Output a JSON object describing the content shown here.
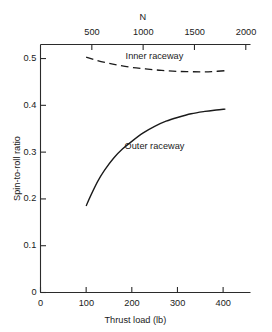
{
  "chart_data": {
    "type": "line",
    "title": "",
    "xlabel": "Thrust load (lb)",
    "ylabel": "Spin-to-roll ratio",
    "secondary_xlabel": "N",
    "xlim": [
      0,
      460
    ],
    "ylim": [
      0,
      0.53
    ],
    "secondary_xlim": [
      0,
      2046
    ],
    "xticks": [
      0,
      100,
      200,
      300,
      400
    ],
    "xtick_labels": [
      "0",
      "100",
      "200",
      "300",
      "400"
    ],
    "yticks": [
      0,
      0.1,
      0.2,
      0.3,
      0.4,
      0.5
    ],
    "ytick_labels": [
      "0",
      "0.1",
      "0.2",
      "0.3",
      "0.4",
      "0.5"
    ],
    "secondary_xticks": [
      500,
      1000,
      1500,
      2000
    ],
    "secondary_xtick_labels": [
      "500",
      "1000",
      "1500",
      "2000"
    ],
    "grid": false,
    "legend": "inline-annotations",
    "series": [
      {
        "name": "Inner raceway",
        "style": "dashed",
        "color": "#1a1a1a",
        "label_x": 250,
        "label_y": 0.505,
        "x": [
          100,
          120,
          145,
          170,
          200,
          230,
          260,
          290,
          320,
          350,
          375,
          405
        ],
        "y": [
          0.503,
          0.497,
          0.491,
          0.486,
          0.481,
          0.478,
          0.475,
          0.473,
          0.472,
          0.4715,
          0.472,
          0.474
        ]
      },
      {
        "name": "Outer raceway",
        "style": "solid",
        "color": "#1a1a1a",
        "label_x": 250,
        "label_y": 0.313,
        "x": [
          100,
          110,
          125,
          140,
          160,
          180,
          200,
          225,
          250,
          275,
          300,
          330,
          360,
          385,
          405
        ],
        "y": [
          0.185,
          0.207,
          0.237,
          0.261,
          0.287,
          0.307,
          0.323,
          0.341,
          0.355,
          0.366,
          0.374,
          0.382,
          0.387,
          0.39,
          0.392
        ]
      }
    ]
  },
  "axes": {
    "left_spine": true,
    "top_spine": true,
    "bottom_spine": true,
    "right_spine": false,
    "tick_direction_bottom": "up",
    "tick_direction_top": "down",
    "tick_direction_left": "right"
  }
}
